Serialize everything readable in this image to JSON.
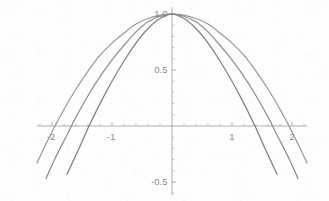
{
  "chart_data": {
    "type": "line",
    "title": "",
    "xlabel": "",
    "ylabel": "",
    "xlim": [
      -2.25,
      2.25
    ],
    "ylim": [
      -0.62,
      1.06
    ],
    "grid": false,
    "legend_position": "none",
    "axes_style": "crossed-at-origin",
    "x_tick_labels": [
      "-2",
      "-1",
      "1",
      "2"
    ],
    "x_tick_values": [
      -2,
      -1,
      1,
      2
    ],
    "y_tick_labels": [
      "1.0",
      "0.5",
      "-0.5"
    ],
    "y_tick_values": [
      1.0,
      0.5,
      -0.5
    ],
    "minor_ticks": true,
    "x_minor_step": 0.2,
    "y_minor_step": 0.1,
    "series": [
      {
        "name": "widest-curve",
        "color": "#9a9a9a",
        "zero_crossings": [
          -1.95,
          1.95
        ],
        "peak": {
          "x": 0,
          "y": 1.0
        },
        "x": [
          -2.25,
          -2.1,
          -1.95,
          -1.8,
          -1.6,
          -1.4,
          -1.2,
          -1.0,
          -0.8,
          -0.6,
          -0.4,
          -0.2,
          0,
          0.2,
          0.4,
          0.6,
          0.8,
          1.0,
          1.2,
          1.4,
          1.6,
          1.8,
          1.95,
          2.1,
          2.25
        ],
        "y": [
          -0.33,
          -0.16,
          0.0,
          0.15,
          0.33,
          0.49,
          0.63,
          0.74,
          0.83,
          0.91,
          0.96,
          0.99,
          1.0,
          0.99,
          0.96,
          0.91,
          0.83,
          0.74,
          0.63,
          0.49,
          0.33,
          0.15,
          0.0,
          -0.16,
          -0.33
        ]
      },
      {
        "name": "middle-curve",
        "color": "#8d8d8d",
        "zero_crossings": [
          -1.75,
          1.75
        ],
        "peak": {
          "x": 0,
          "y": 1.0
        },
        "x": [
          -2.25,
          -2.1,
          -1.95,
          -1.75,
          -1.6,
          -1.4,
          -1.2,
          -1.0,
          -0.8,
          -0.6,
          -0.4,
          -0.2,
          0,
          0.2,
          0.4,
          0.6,
          0.8,
          1.0,
          1.2,
          1.4,
          1.6,
          1.75,
          1.95,
          2.1,
          2.25
        ],
        "y": [
          -0.66,
          -0.47,
          -0.29,
          -0.08,
          0.08,
          0.27,
          0.44,
          0.59,
          0.72,
          0.84,
          0.93,
          0.98,
          1.0,
          0.98,
          0.93,
          0.84,
          0.72,
          0.59,
          0.44,
          0.27,
          0.08,
          -0.08,
          -0.29,
          -0.47,
          -0.66
        ]
      },
      {
        "name": "narrowest-curve",
        "color": "#808080",
        "zero_crossings": [
          -1.55,
          1.55
        ],
        "peak": {
          "x": 0,
          "y": 1.0
        },
        "x": [
          -2.1,
          -1.95,
          -1.75,
          -1.55,
          -1.4,
          -1.2,
          -1.0,
          -0.8,
          -0.6,
          -0.4,
          -0.2,
          0,
          0.2,
          0.4,
          0.6,
          0.8,
          1.0,
          1.2,
          1.4,
          1.55,
          1.75,
          1.95,
          2.1
        ],
        "y": [
          -0.87,
          -0.67,
          -0.43,
          -0.2,
          -0.02,
          0.2,
          0.4,
          0.58,
          0.74,
          0.87,
          0.96,
          1.0,
          0.96,
          0.87,
          0.74,
          0.58,
          0.4,
          0.2,
          -0.02,
          -0.2,
          -0.43,
          -0.67,
          -0.87
        ]
      }
    ],
    "colors": {
      "axis": "#a7a7a7",
      "tick_text": "#8a8a8a",
      "background": "#fdfdfd"
    }
  }
}
